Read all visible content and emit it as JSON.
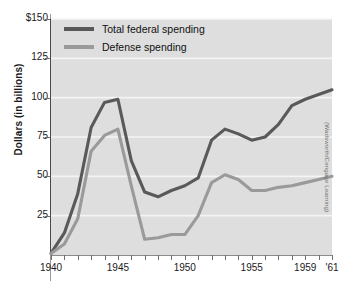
{
  "axes": {
    "ylabel": "Dollars (in billions)",
    "ytick_labels": [
      "$150",
      "125",
      "100",
      "75",
      "50",
      "25"
    ],
    "xtick_labels": [
      "1940",
      "1945",
      "1950",
      "1955",
      "1959",
      "'61"
    ]
  },
  "legend": {
    "items": [
      {
        "label": "Total federal spending",
        "color": "#595959"
      },
      {
        "label": "Defense spending",
        "color": "#9a9a9a"
      }
    ]
  },
  "credit": "(Wadsworth/Cengage Learning)",
  "colors": {
    "plot_background": "#dedede",
    "gridline": "#f4f4f4",
    "total_line": "#595959",
    "defense_line": "#9a9a9a",
    "axis": "#4a4a4a",
    "text": "#1a1a1a"
  },
  "chart_data": {
    "type": "line",
    "title": "",
    "xlabel": "",
    "ylabel": "Dollars (in billions)",
    "xlim": [
      1940,
      1961
    ],
    "ylim": [
      0,
      150
    ],
    "yticks": [
      25,
      50,
      75,
      100,
      125,
      150
    ],
    "xticks": [
      1940,
      1941,
      1942,
      1943,
      1944,
      1945,
      1946,
      1947,
      1948,
      1949,
      1950,
      1951,
      1952,
      1953,
      1954,
      1955,
      1956,
      1957,
      1958,
      1959,
      1960,
      1961
    ],
    "xtick_labels_shown": [
      "1940",
      "1945",
      "1950",
      "1955",
      "1959",
      "'61"
    ],
    "grid": "horizontal",
    "legend_position": "upper left",
    "x": [
      1940,
      1941,
      1942,
      1943,
      1944,
      1945,
      1946,
      1947,
      1948,
      1949,
      1950,
      1951,
      1952,
      1953,
      1954,
      1955,
      1956,
      1957,
      1958,
      1959,
      1960,
      1961
    ],
    "series": [
      {
        "name": "Total federal spending",
        "color": "#595959",
        "values": [
          1,
          14,
          39,
          81,
          97,
          99,
          60,
          40,
          37,
          41,
          44,
          49,
          73,
          80,
          77,
          73,
          75,
          83,
          95,
          99,
          102,
          105
        ]
      },
      {
        "name": "Defense spending",
        "color": "#9a9a9a",
        "values": [
          1,
          7,
          23,
          66,
          76,
          80,
          44,
          10,
          11,
          13,
          13,
          25,
          46,
          51,
          48,
          41,
          41,
          43,
          44,
          46,
          48,
          50
        ]
      }
    ]
  }
}
